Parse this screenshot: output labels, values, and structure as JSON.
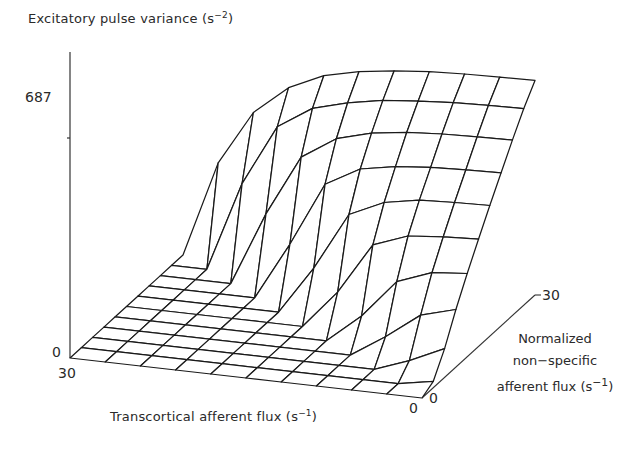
{
  "chart_data": {
    "type": "surface3d",
    "title": "",
    "zlabel": "Excitatory pulse variance",
    "zlabel_unit_base": "s",
    "zlabel_unit_exp": "−2",
    "xlabel": "Transcortical afferent flux",
    "xlabel_unit_base": "s",
    "xlabel_unit_exp": "−1",
    "ylabel_lines": [
      "Normalized",
      "non−specific"
    ],
    "ylabel_last": "afferent flux",
    "ylabel_unit_base": "s",
    "ylabel_unit_exp": "−1",
    "z_ticks": [
      "0",
      "687"
    ],
    "z_tick_values": [
      0,
      687
    ],
    "x_ticks": {
      "start": "30",
      "end": "0"
    },
    "y_ticks": {
      "start": "0",
      "end": "30"
    },
    "xlim": [
      30,
      0
    ],
    "ylim": [
      0,
      30
    ],
    "zlim": [
      0,
      687
    ],
    "x_values": [
      30,
      27,
      24,
      21,
      18,
      15,
      12,
      9,
      6,
      3,
      0
    ],
    "y_values": [
      0,
      3,
      6,
      9,
      12,
      15,
      18,
      21,
      24,
      27,
      30
    ],
    "z_grid": [
      [
        0,
        0,
        0,
        0,
        0,
        0,
        0,
        0,
        0,
        0,
        0
      ],
      [
        0,
        0,
        0,
        0,
        0,
        0,
        0,
        0,
        0,
        0,
        20
      ],
      [
        0,
        0,
        0,
        0,
        0,
        0,
        0,
        0,
        0,
        40,
        90
      ],
      [
        0,
        0,
        0,
        0,
        0,
        0,
        0,
        0,
        70,
        150,
        180
      ],
      [
        0,
        0,
        0,
        0,
        0,
        0,
        0,
        90,
        210,
        250,
        260
      ],
      [
        0,
        0,
        0,
        0,
        0,
        0,
        120,
        280,
        320,
        330,
        335
      ],
      [
        0,
        0,
        0,
        0,
        0,
        150,
        330,
        380,
        400,
        405,
        408
      ],
      [
        0,
        0,
        0,
        0,
        180,
        380,
        440,
        460,
        470,
        475,
        478
      ],
      [
        0,
        0,
        0,
        230,
        420,
        490,
        520,
        535,
        542,
        546,
        548
      ],
      [
        0,
        0,
        280,
        470,
        540,
        570,
        590,
        600,
        608,
        612,
        614
      ],
      [
        0,
        300,
        470,
        560,
        610,
        635,
        650,
        660,
        665,
        668,
        670
      ]
    ]
  },
  "figure": {
    "bottom_cut_text": "· · · · · · · · · · · · · · · · · · ·"
  }
}
